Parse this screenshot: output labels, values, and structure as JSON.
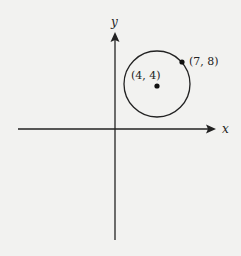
{
  "diagram": {
    "axes": {
      "x_label": "x",
      "y_label": "y"
    },
    "circle": {
      "center_label": "(4, 4)",
      "point_label": "(7, 8)",
      "center": [
        4,
        4
      ],
      "point_on_circle": [
        7,
        8
      ]
    },
    "colors": {
      "background": "#f2f2f0",
      "ink": "#222222"
    }
  }
}
